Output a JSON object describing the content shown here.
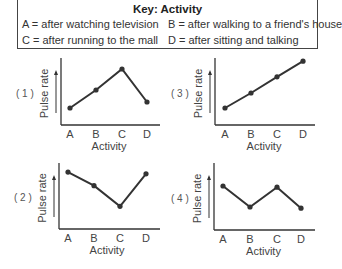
{
  "key": {
    "title": "Key: Activity",
    "items": [
      {
        "letter": "A",
        "text": "A = after watching television"
      },
      {
        "letter": "B",
        "text": "B = after walking to a friend's house"
      },
      {
        "letter": "C",
        "text": "C = after running to the mall"
      },
      {
        "letter": "D",
        "text": "D = after sitting and talking"
      }
    ]
  },
  "colors": {
    "line": "#333333",
    "axis": "#333333",
    "text": "#444444"
  },
  "chart_data": [
    {
      "type": "line",
      "option": "( 1 )",
      "categories": [
        "A",
        "B",
        "C",
        "D"
      ],
      "values": [
        0.2,
        0.5,
        0.85,
        0.3
      ],
      "xlabel": "Activity",
      "ylabel": "Pulse rate",
      "ylim": [
        0,
        1
      ]
    },
    {
      "type": "line",
      "option": "( 3 )",
      "categories": [
        "A",
        "B",
        "C",
        "D"
      ],
      "values": [
        0.2,
        0.45,
        0.72,
        0.98
      ],
      "xlabel": "Activity",
      "ylabel": "Pulse rate",
      "ylim": [
        0,
        1
      ]
    },
    {
      "type": "line",
      "option": "( 2 )",
      "categories": [
        "A",
        "B",
        "C",
        "D"
      ],
      "values": [
        0.88,
        0.65,
        0.3,
        0.85
      ],
      "xlabel": "Activity",
      "ylabel": "Pulse rate",
      "ylim": [
        0,
        1
      ]
    },
    {
      "type": "line",
      "option": "( 4 )",
      "categories": [
        "A",
        "B",
        "C",
        "D"
      ],
      "values": [
        0.65,
        0.3,
        0.63,
        0.28
      ],
      "xlabel": "Activity",
      "ylabel": "Pulse rate",
      "ylim": [
        0,
        1
      ]
    }
  ]
}
